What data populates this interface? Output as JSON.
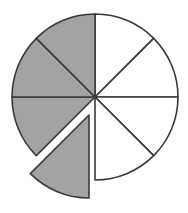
{
  "diagram": {
    "type": "fraction-circle",
    "total_slices": 8,
    "shaded_slices": 4,
    "exploded_slices": 1,
    "colors": {
      "shaded_fill": "#a3a3a3",
      "unshaded_fill": "#ffffff",
      "stroke": "#3a3a3a"
    },
    "center": [
      95,
      97
    ],
    "radius": 83,
    "explode_offset": [
      -6,
      18
    ],
    "slices": [
      {
        "index": 0,
        "start_deg": 0,
        "end_deg": 45,
        "shaded": false,
        "exploded": false
      },
      {
        "index": 1,
        "start_deg": 45,
        "end_deg": 90,
        "shaded": false,
        "exploded": false
      },
      {
        "index": 2,
        "start_deg": 90,
        "end_deg": 135,
        "shaded": false,
        "exploded": false
      },
      {
        "index": 3,
        "start_deg": 135,
        "end_deg": 180,
        "shaded": false,
        "exploded": false
      },
      {
        "index": 4,
        "start_deg": 180,
        "end_deg": 225,
        "shaded": true,
        "exploded": true
      },
      {
        "index": 5,
        "start_deg": 225,
        "end_deg": 270,
        "shaded": true,
        "exploded": false
      },
      {
        "index": 6,
        "start_deg": 270,
        "end_deg": 315,
        "shaded": true,
        "exploded": false
      },
      {
        "index": 7,
        "start_deg": 315,
        "end_deg": 360,
        "shaded": true,
        "exploded": false
      }
    ]
  }
}
